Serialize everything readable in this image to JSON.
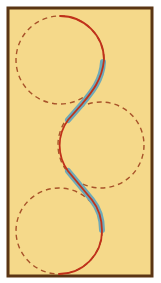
{
  "diagram": {
    "type": "path-on-circles",
    "colors": {
      "background": "#f5d98a",
      "border": "#5a3514",
      "path": "#c0311a",
      "dashed_circle": "#a8532a",
      "tangent_highlight": "#6fa9b8"
    },
    "frame": {
      "x": 8,
      "y": 8,
      "width": 144,
      "height": 268
    },
    "circles": [
      {
        "name": "top",
        "cx": 60,
        "cy": 60,
        "r": 44
      },
      {
        "name": "middle",
        "cx": 101,
        "cy": 145,
        "r": 43
      },
      {
        "name": "bottom",
        "cx": 59,
        "cy": 231,
        "r": 43
      }
    ],
    "path_segments": [
      {
        "kind": "arc",
        "circle": "top",
        "from": "top",
        "to": "right"
      },
      {
        "kind": "tangent",
        "circle_from": "top",
        "circle_to": "middle",
        "highlighted": true
      },
      {
        "kind": "arc",
        "circle": "middle",
        "side": "left"
      },
      {
        "kind": "tangent",
        "circle_from": "middle",
        "circle_to": "bottom",
        "highlighted": true
      },
      {
        "kind": "arc",
        "circle": "bottom",
        "from": "right",
        "to": "bottom"
      }
    ]
  }
}
